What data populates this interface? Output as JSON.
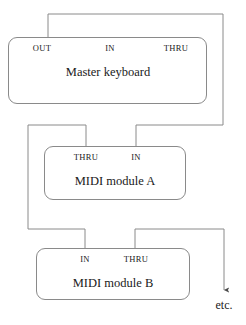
{
  "diagram": {
    "line_color": "#8a8a8a",
    "text_color": "#1a1a1a",
    "background_color": "#ffffff",
    "devices": [
      {
        "id": "master-keyboard",
        "title": "Master keyboard",
        "ports": [
          {
            "id": "out",
            "label": "OUT"
          },
          {
            "id": "in",
            "label": "IN"
          },
          {
            "id": "thru",
            "label": "THRU"
          }
        ]
      },
      {
        "id": "midi-module-a",
        "title": "MIDI module A",
        "ports": [
          {
            "id": "thru",
            "label": "THRU"
          },
          {
            "id": "in",
            "label": "IN"
          }
        ]
      },
      {
        "id": "midi-module-b",
        "title": "MIDI module B",
        "ports": [
          {
            "id": "in",
            "label": "IN"
          },
          {
            "id": "thru",
            "label": "THRU"
          }
        ]
      }
    ],
    "continuation_label": "etc.",
    "cables": [
      {
        "id": "cable-master-out-to-module-a-in",
        "from": "master-keyboard.out",
        "to": "midi-module-a.in",
        "path": "M48,37 L48,14 L223,14 L223,125 L136,125 L136,146"
      },
      {
        "id": "cable-module-a-thru-to-module-b-in",
        "from": "midi-module-a.thru",
        "to": "midi-module-b.in",
        "path": "M86,146 L86,125 L28,125 L28,229 L85,229 L85,248"
      },
      {
        "id": "cable-module-b-thru-to-etc",
        "from": "midi-module-b.thru",
        "to": "etc.",
        "path": "M135,248 L135,229 L224,229 L224,290"
      }
    ]
  }
}
